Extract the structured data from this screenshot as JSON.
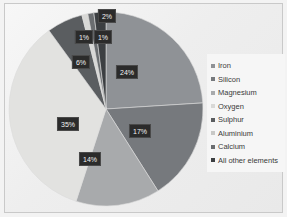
{
  "chart_data": {
    "type": "pie",
    "title": "",
    "subtitle": "",
    "xlabel": "",
    "ylabel": "",
    "legend_position": "right",
    "grid": false,
    "categories": [
      "Iron",
      "Silicon",
      "Magnesium",
      "Oxygen",
      "Sulphur",
      "Aluminium",
      "Calcium",
      "All other elements"
    ],
    "values": [
      24,
      17,
      14,
      35,
      6,
      1,
      1,
      2
    ],
    "value_labels": [
      "24%",
      "17%",
      "14%",
      "35%",
      "6%",
      "1%",
      "1%",
      "2%"
    ],
    "colors": [
      "#8f9296",
      "#76797d",
      "#a8aaac",
      "#e2e2e0",
      "#5a5d60",
      "#d8d8d6",
      "#6a6d70",
      "#3c3f42"
    ],
    "slices": [
      {
        "label": "Iron",
        "value": 24,
        "value_label": "24%",
        "color": "#8f9296"
      },
      {
        "label": "Silicon",
        "value": 17,
        "value_label": "17%",
        "color": "#76797d"
      },
      {
        "label": "Magnesium",
        "value": 14,
        "value_label": "14%",
        "color": "#a8aaac"
      },
      {
        "label": "Oxygen",
        "value": 35,
        "value_label": "35%",
        "color": "#e2e2e0"
      },
      {
        "label": "Sulphur",
        "value": 6,
        "value_label": "6%",
        "color": "#5a5d60"
      },
      {
        "label": "Aluminium",
        "value": 1,
        "value_label": "1%",
        "color": "#d8d8d6"
      },
      {
        "label": "Calcium",
        "value": 1,
        "value_label": "1%",
        "color": "#6a6d70"
      },
      {
        "label": "All other elements",
        "value": 2,
        "value_label": "2%",
        "color": "#3c3f42"
      }
    ]
  },
  "legend": {
    "items": [
      {
        "label": "Iron",
        "color": "#8f9296"
      },
      {
        "label": "Silicon",
        "color": "#76797d"
      },
      {
        "label": "Magnesium",
        "color": "#a8aaac"
      },
      {
        "label": "Oxygen",
        "color": "#d9d9d7"
      },
      {
        "label": "Sulphur",
        "color": "#5a5d60"
      },
      {
        "label": "Aluminium",
        "color": "#c8c8c6"
      },
      {
        "label": "Calcium",
        "color": "#6a6d70"
      },
      {
        "label": "All other elements",
        "color": "#3c3f42"
      }
    ]
  },
  "labels": {
    "iron": "24%",
    "silicon": "17%",
    "magnesium": "14%",
    "oxygen": "35%",
    "sulphur": "6%",
    "aluminium": "1%",
    "calcium": "1%",
    "other": "2%"
  }
}
